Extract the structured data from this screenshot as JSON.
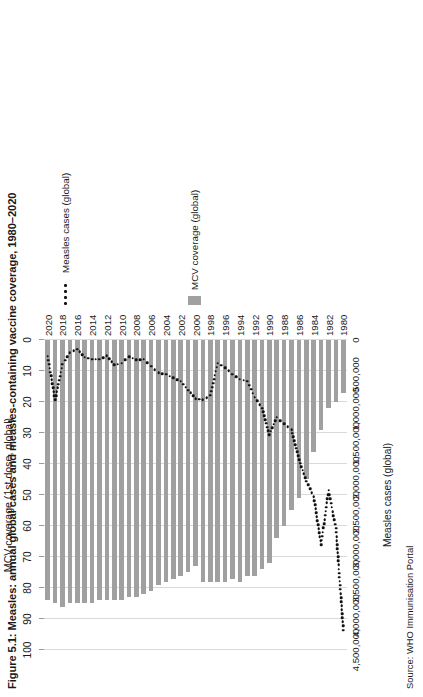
{
  "figure": {
    "title": "Figure 5.1: Measles: annual global cases and measles-containing vaccine coverage, 1980–2020",
    "source": "Source: WHO Immunisation Portal"
  },
  "legend": {
    "cases_label": "Measles cases (global)",
    "coverage_label": "MCV coverage (global)",
    "cases_marker": "dotted-line-marker",
    "coverage_marker": "bar-swatch-marker"
  },
  "colors": {
    "bar": "#a0a0a0",
    "dots": "#111111",
    "grid": "#d9d9d9",
    "text": "#1a1a1a"
  },
  "chart_data": {
    "type": "bar",
    "title": "Figure 5.1: Measles: annual global cases and measles-containing vaccine coverage, 1980–2020",
    "xlabel": "MCV coverage (1st dose, global)",
    "ylabel": "Measles cases (global)",
    "grid": true,
    "legend_position": "right",
    "coverage_axis": {
      "name": "MCV coverage (1st dose, global)",
      "ticks": [
        100,
        90,
        80,
        70,
        60,
        50,
        40,
        30,
        20,
        10,
        0
      ],
      "tick_labels": [
        "100",
        "90",
        "80",
        "70",
        "60",
        "50",
        "40",
        "30",
        "20",
        "10",
        "0"
      ],
      "lim": [
        0,
        100
      ],
      "reversed": true
    },
    "cases_axis": {
      "name": "Measles cases (global)",
      "ticks": [
        4500000,
        4000000,
        3500000,
        3000000,
        2500000,
        2000000,
        1500000,
        1000000,
        500000,
        0
      ],
      "tick_labels": [
        "4,500,000",
        "4,000,000",
        "3,500,000",
        "3,000,000",
        "2,500,000",
        "2,000,000",
        "1,500,000",
        "1,000,000",
        "500,000",
        "0"
      ],
      "lim": [
        0,
        4500000
      ],
      "reversed": true
    },
    "categories": [
      1980,
      1981,
      1982,
      1983,
      1984,
      1985,
      1986,
      1987,
      1988,
      1989,
      1990,
      1991,
      1992,
      1993,
      1994,
      1995,
      1996,
      1997,
      1998,
      1999,
      2000,
      2001,
      2002,
      2003,
      2004,
      2005,
      2006,
      2007,
      2008,
      2009,
      2010,
      2011,
      2012,
      2013,
      2014,
      2015,
      2016,
      2017,
      2018,
      2019,
      2020
    ],
    "category_tick_labels": [
      "1980",
      "1982",
      "1984",
      "1986",
      "1988",
      "1990",
      "1992",
      "1994",
      "1996",
      "1998",
      "2000",
      "2002",
      "2004",
      "2006",
      "2008",
      "2010",
      "2012",
      "2014",
      "2016",
      "2018",
      "2020"
    ],
    "series": [
      {
        "name": "MCV coverage (global)",
        "type": "bar",
        "unit": "%",
        "values": [
          17,
          20,
          22,
          29,
          36,
          45,
          51,
          55,
          60,
          64,
          72,
          74,
          76,
          76,
          78,
          77,
          78,
          78,
          78,
          78,
          73,
          75,
          76,
          77,
          78,
          79,
          81,
          82,
          83,
          83,
          84,
          84,
          84,
          84,
          85,
          85,
          85,
          85,
          86,
          85,
          84
        ],
        "color": "#a0a0a0"
      },
      {
        "name": "Measles cases (global)",
        "type": "line",
        "style": "dotted",
        "unit": "cases",
        "values": [
          4211431,
          2735122,
          2184180,
          2970688,
          2274000,
          2050000,
          1735000,
          1300000,
          1220000,
          1120000,
          1374083,
          990000,
          830000,
          600000,
          570000,
          500000,
          400000,
          340000,
          800000,
          870000,
          850000,
          730000,
          600000,
          550000,
          500000,
          480000,
          380000,
          280000,
          290000,
          240000,
          340000,
          360000,
          230000,
          280000,
          280000,
          250000,
          132490,
          185200,
          353236,
          870000,
          235000
        ],
        "color": "#111111"
      }
    ]
  }
}
